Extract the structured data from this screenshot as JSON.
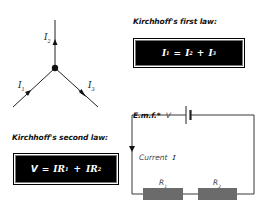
{
  "junction": {
    "labels": {
      "i1": "I",
      "i1_sub": "1",
      "i2": "I",
      "i2_sub": "2",
      "i3": "I",
      "i3_sub": "3"
    }
  },
  "first_law": {
    "heading": "Kirchhoff's first law:",
    "equation": {
      "lhs": "I",
      "lhs_sub": "1",
      "eq": "=",
      "t1": "I",
      "t1_sub": "2",
      "plus": "+",
      "t2": "I",
      "t2_sub": "3"
    }
  },
  "second_law": {
    "heading": "Kirchhoff's second law:",
    "equation": {
      "lhs": "V",
      "eq": "=",
      "t1": "IR",
      "t1_sub": "1",
      "plus": "+",
      "t2": "IR",
      "t2_sub": "2"
    }
  },
  "circuit": {
    "emf_label": "E.m.f.*",
    "emf_symbol": "V",
    "current_label": "Current",
    "current_symbol": "I",
    "r1": "R",
    "r1_sub": "1",
    "r2": "R",
    "r2_sub": "2"
  },
  "colors": {
    "wire": "#222222",
    "resistor": "#6b6b6b",
    "box": "#000000",
    "box_text": "#ffffff"
  }
}
